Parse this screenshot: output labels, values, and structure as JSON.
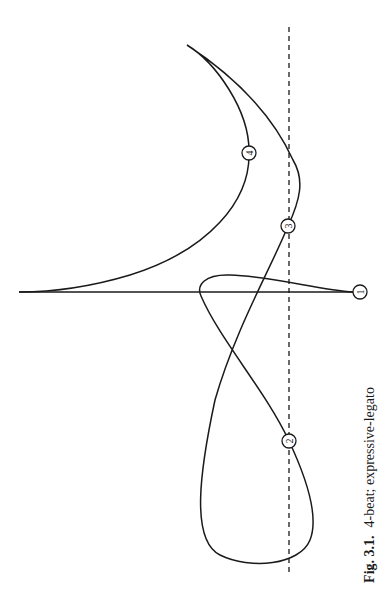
{
  "figure": {
    "caption_label": "Fig. 3.1.",
    "caption_text": "4-beat; expressive-legato",
    "beats": [
      {
        "id": "beat-1",
        "label": "1"
      },
      {
        "id": "beat-2",
        "label": "2"
      },
      {
        "id": "beat-3",
        "label": "3"
      },
      {
        "id": "beat-4",
        "label": "4"
      }
    ],
    "colors": {
      "line": "#1a1a1a",
      "background": "#ffffff"
    }
  }
}
